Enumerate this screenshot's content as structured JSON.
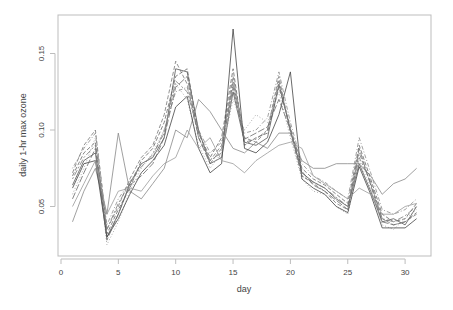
{
  "chart_data": {
    "type": "line",
    "title": "",
    "xlabel": "day",
    "ylabel": "daily 1-hr max ozone",
    "xlim": [
      0,
      32
    ],
    "ylim": [
      0.018,
      0.172
    ],
    "xticks": [
      0,
      5,
      10,
      15,
      20,
      25,
      30
    ],
    "xtick_labels": [
      "0",
      "5",
      "10",
      "15",
      "20",
      "25",
      "30"
    ],
    "yticks": [
      0.05,
      0.1,
      0.15
    ],
    "ytick_labels": [
      "0.05",
      "0.10",
      "0.15"
    ],
    "grid": false,
    "legend": null,
    "x": [
      1,
      2,
      3,
      4,
      5,
      6,
      7,
      8,
      9,
      10,
      11,
      12,
      13,
      14,
      15,
      16,
      17,
      18,
      19,
      20,
      21,
      22,
      23,
      24,
      25,
      26,
      27,
      28,
      29,
      30,
      31
    ],
    "series": [
      {
        "name": "station 1",
        "style": "solid",
        "values": [
          0.064,
          0.08,
          0.085,
          0.03,
          0.045,
          0.065,
          0.078,
          0.082,
          0.095,
          0.14,
          0.138,
          0.1,
          0.078,
          0.082,
          0.125,
          0.092,
          0.09,
          0.095,
          0.13,
          0.1,
          0.072,
          0.066,
          0.062,
          0.055,
          0.05,
          0.078,
          0.06,
          0.04,
          0.042,
          0.038,
          0.05
        ]
      },
      {
        "name": "station 2",
        "style": "dashed",
        "values": [
          0.072,
          0.09,
          0.1,
          0.035,
          0.05,
          0.068,
          0.082,
          0.09,
          0.11,
          0.145,
          0.13,
          0.095,
          0.08,
          0.09,
          0.135,
          0.095,
          0.092,
          0.1,
          0.135,
          0.098,
          0.07,
          0.065,
          0.06,
          0.052,
          0.048,
          0.085,
          0.065,
          0.042,
          0.038,
          0.04,
          0.045
        ]
      },
      {
        "name": "station 3",
        "style": "dotted",
        "values": [
          0.058,
          0.075,
          0.095,
          0.025,
          0.04,
          0.06,
          0.075,
          0.085,
          0.1,
          0.13,
          0.12,
          0.09,
          0.075,
          0.085,
          0.12,
          0.1,
          0.11,
          0.105,
          0.125,
          0.095,
          0.068,
          0.06,
          0.058,
          0.05,
          0.045,
          0.08,
          0.062,
          0.038,
          0.035,
          0.042,
          0.048
        ]
      },
      {
        "name": "station 4",
        "style": "solid",
        "values": [
          0.04,
          0.06,
          0.075,
          0.045,
          0.098,
          0.06,
          0.055,
          0.065,
          0.075,
          0.1,
          0.095,
          0.12,
          0.112,
          0.1,
          0.088,
          0.085,
          0.092,
          0.088,
          0.098,
          0.098,
          0.08,
          0.075,
          0.075,
          0.078,
          0.078,
          0.078,
          0.07,
          0.058,
          0.065,
          0.068,
          0.075
        ]
      },
      {
        "name": "station 5",
        "style": "dashed",
        "values": [
          0.07,
          0.085,
          0.092,
          0.032,
          0.048,
          0.062,
          0.08,
          0.088,
          0.105,
          0.135,
          0.14,
          0.098,
          0.082,
          0.095,
          0.14,
          0.09,
          0.095,
          0.098,
          0.128,
          0.102,
          0.075,
          0.068,
          0.064,
          0.058,
          0.052,
          0.09,
          0.068,
          0.045,
          0.04,
          0.042,
          0.052
        ]
      },
      {
        "name": "station 6",
        "style": "solid",
        "values": [
          0.062,
          0.078,
          0.08,
          0.03,
          0.042,
          0.058,
          0.072,
          0.08,
          0.09,
          0.115,
          0.122,
          0.088,
          0.072,
          0.078,
          0.166,
          0.088,
          0.085,
          0.092,
          0.11,
          0.138,
          0.068,
          0.062,
          0.058,
          0.05,
          0.046,
          0.076,
          0.058,
          0.036,
          0.036,
          0.036,
          0.042
        ]
      },
      {
        "name": "station 7",
        "style": "dotdash",
        "values": [
          0.075,
          0.088,
          0.098,
          0.038,
          0.055,
          0.066,
          0.078,
          0.082,
          0.1,
          0.125,
          0.128,
          0.1,
          0.085,
          0.092,
          0.13,
          0.098,
          0.1,
          0.108,
          0.138,
          0.105,
          0.078,
          0.07,
          0.066,
          0.06,
          0.055,
          0.095,
          0.072,
          0.048,
          0.045,
          0.048,
          0.055
        ]
      },
      {
        "name": "station 8",
        "style": "longdash",
        "values": [
          0.055,
          0.072,
          0.088,
          0.028,
          0.045,
          0.064,
          0.07,
          0.078,
          0.095,
          0.128,
          0.135,
          0.095,
          0.078,
          0.088,
          0.128,
          0.094,
          0.098,
          0.102,
          0.12,
          0.1,
          0.073,
          0.064,
          0.06,
          0.054,
          0.048,
          0.088,
          0.064,
          0.04,
          0.038,
          0.04,
          0.046
        ]
      },
      {
        "name": "station 9",
        "style": "solid",
        "values": [
          0.05,
          0.065,
          0.08,
          0.045,
          0.06,
          0.062,
          0.06,
          0.07,
          0.078,
          0.082,
          0.1,
          0.088,
          0.095,
          0.08,
          0.078,
          0.072,
          0.08,
          0.085,
          0.09,
          0.092,
          0.088,
          0.07,
          0.065,
          0.06,
          0.055,
          0.062,
          0.058,
          0.045,
          0.045,
          0.05,
          0.052
        ]
      },
      {
        "name": "station 10",
        "style": "twodash",
        "values": [
          0.068,
          0.082,
          0.09,
          0.035,
          0.052,
          0.065,
          0.076,
          0.084,
          0.098,
          0.132,
          0.125,
          0.098,
          0.08,
          0.085,
          0.132,
          0.092,
          0.094,
          0.1,
          0.132,
          0.1,
          0.07,
          0.066,
          0.062,
          0.056,
          0.05,
          0.082,
          0.066,
          0.042,
          0.04,
          0.044,
          0.05
        ]
      }
    ]
  }
}
